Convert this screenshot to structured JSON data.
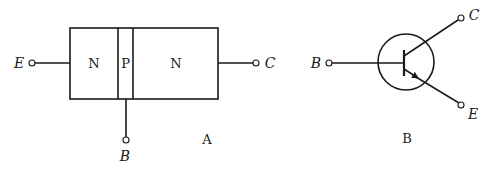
{
  "diagram_a": {
    "caption": "A",
    "regions": [
      {
        "label": "N"
      },
      {
        "label": "P"
      },
      {
        "label": "N"
      }
    ],
    "terminals": {
      "emitter": "E",
      "base": "B",
      "collector": "C"
    }
  },
  "diagram_b": {
    "caption": "B",
    "terminals": {
      "base": "B",
      "collector": "C",
      "emitter": "E"
    }
  },
  "colors": {
    "stroke": "#1a1a1a",
    "background": "#ffffff"
  }
}
